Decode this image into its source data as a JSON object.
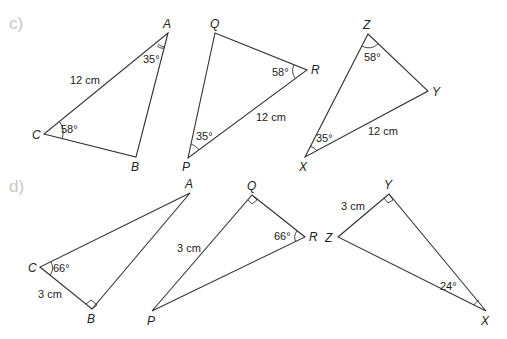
{
  "parts": [
    {
      "label": "c)",
      "triangles": [
        {
          "name": "ABC",
          "vertices": {
            "A": "A",
            "B": "B",
            "C": "C"
          },
          "measures": {
            "side_AC": "12 cm",
            "angle_A": "35°",
            "angle_C": "58°"
          }
        },
        {
          "name": "PQR",
          "vertices": {
            "P": "P",
            "Q": "Q",
            "R": "R"
          },
          "measures": {
            "side_PR": "12 cm",
            "angle_P": "35°",
            "angle_R": "58°"
          }
        },
        {
          "name": "XYZ",
          "vertices": {
            "X": "X",
            "Y": "Y",
            "Z": "Z"
          },
          "measures": {
            "side_XY": "12 cm",
            "angle_X": "35°",
            "angle_Z": "58°"
          }
        }
      ]
    },
    {
      "label": "d)",
      "triangles": [
        {
          "name": "ABC",
          "vertices": {
            "A": "A",
            "B": "B",
            "C": "C"
          },
          "measures": {
            "side_CB": "3 cm",
            "angle_C": "66°",
            "right_angle": "B"
          }
        },
        {
          "name": "PQR",
          "vertices": {
            "P": "P",
            "Q": "Q",
            "R": "R"
          },
          "measures": {
            "side_PQ": "3 cm",
            "angle_R": "66°",
            "right_angle": "Q"
          }
        },
        {
          "name": "XYZ",
          "vertices": {
            "X": "X",
            "Y": "Y",
            "Z": "Z"
          },
          "measures": {
            "side_ZY": "3 cm",
            "angle_X": "24°",
            "right_angle": "Y"
          }
        }
      ]
    }
  ],
  "colors": {
    "line": "#333333",
    "text": "#222222",
    "part_label": "#c8c8c8"
  }
}
